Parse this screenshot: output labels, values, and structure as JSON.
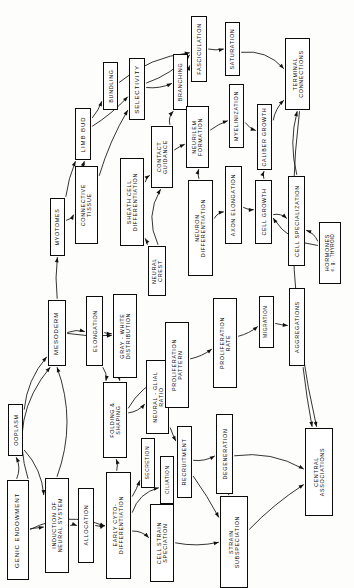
{
  "diagram": {
    "orientation": "sideways-landscape",
    "background_color": "#fdfdfb",
    "line_color": "#111111",
    "box_fill": "#ffffff",
    "box_stroke": "#0b0b0b",
    "nodes": [
      {
        "id": "ooplasm",
        "label": "OOPLASM",
        "x": 8,
        "y": 404,
        "w": 15,
        "h": 52,
        "size": "small"
      },
      {
        "id": "genic_endowment",
        "label": "GENIC ENDOWMENT",
        "x": 7,
        "y": 480,
        "w": 22,
        "h": 100,
        "size": ""
      },
      {
        "id": "induction",
        "label": "INDUCTION OF\nNEURAL SYSTEM",
        "x": 45,
        "y": 478,
        "w": 24,
        "h": 95,
        "size": "small"
      },
      {
        "id": "allocation",
        "label": "ALLOCATION",
        "x": 78,
        "y": 488,
        "w": 16,
        "h": 75,
        "size": "small"
      },
      {
        "id": "early_cyto",
        "label": "EARLY CYTO-\nDIFFERENTIATION",
        "x": 106,
        "y": 472,
        "w": 25,
        "h": 107,
        "size": "small"
      },
      {
        "id": "cell_strain_spec",
        "label": "CELL STRAIN\nSPECIATION",
        "x": 150,
        "y": 504,
        "w": 24,
        "h": 78,
        "size": "small"
      },
      {
        "id": "secretion",
        "label": "SECRETION",
        "x": 141,
        "y": 438,
        "w": 14,
        "h": 50,
        "size": "tiny"
      },
      {
        "id": "ciliation",
        "label": "CILIATION",
        "x": 160,
        "y": 456,
        "w": 14,
        "h": 48,
        "size": "tiny"
      },
      {
        "id": "mesoderm",
        "label": "MESODERM",
        "x": 48,
        "y": 300,
        "w": 18,
        "h": 66,
        "size": ""
      },
      {
        "id": "elongation",
        "label": "ELONGATION",
        "x": 86,
        "y": 296,
        "w": 17,
        "h": 70,
        "size": "small"
      },
      {
        "id": "gray_white",
        "label": "GRAY - WHITE\nDISTRIBUTION",
        "x": 113,
        "y": 294,
        "w": 24,
        "h": 84,
        "size": "small"
      },
      {
        "id": "folding_shaping",
        "label": "FOLDING &\nSHAPING",
        "x": 103,
        "y": 382,
        "w": 24,
        "h": 76,
        "size": "small"
      },
      {
        "id": "neural_glial",
        "label": "NEURAL - GLIAL\nRATIO",
        "x": 146,
        "y": 360,
        "w": 23,
        "h": 74,
        "size": "small"
      },
      {
        "id": "recruitment",
        "label": "RECRUITMENT",
        "x": 177,
        "y": 426,
        "w": 15,
        "h": 72,
        "size": "small"
      },
      {
        "id": "proliferation_pat",
        "label": "PROLIFERATION\nPATTERN",
        "x": 165,
        "y": 322,
        "w": 24,
        "h": 86,
        "size": "small"
      },
      {
        "id": "proliferation_rate",
        "label": "PROLIFERATION\nRATE",
        "x": 213,
        "y": 298,
        "w": 24,
        "h": 90,
        "size": "small"
      },
      {
        "id": "migration",
        "label": "MIGRATION",
        "x": 259,
        "y": 296,
        "w": 15,
        "h": 52,
        "size": "tiny"
      },
      {
        "id": "aggregations",
        "label": "AGGREGATIONS",
        "x": 289,
        "y": 288,
        "w": 16,
        "h": 78,
        "size": "small"
      },
      {
        "id": "degeneration",
        "label": "DEGENERATION",
        "x": 216,
        "y": 414,
        "w": 17,
        "h": 80,
        "size": "small"
      },
      {
        "id": "strain_subspec",
        "label": "STRAIN\nSUBSPECIATION",
        "x": 220,
        "y": 496,
        "w": 28,
        "h": 92,
        "size": "small"
      },
      {
        "id": "central_assoc",
        "label": "CENTRAL\nASSOCIATIONS",
        "x": 305,
        "y": 428,
        "w": 28,
        "h": 88,
        "size": "small"
      },
      {
        "id": "neural_crest",
        "label": "NEURAL\nCREST",
        "x": 148,
        "y": 246,
        "w": 18,
        "h": 50,
        "size": "small"
      },
      {
        "id": "myotomes",
        "label": "MYOTOMES",
        "x": 50,
        "y": 198,
        "w": 15,
        "h": 58,
        "size": "small"
      },
      {
        "id": "connective_tissue",
        "label": "CONNECTIVE\nTISSUE",
        "x": 75,
        "y": 166,
        "w": 23,
        "h": 78,
        "size": "small"
      },
      {
        "id": "limb_bud",
        "label": "LIMB BUD",
        "x": 75,
        "y": 108,
        "w": 16,
        "h": 52,
        "size": ""
      },
      {
        "id": "sheath_cell",
        "label": "SHEATH CELL\nDIFFERENTIATION",
        "x": 120,
        "y": 158,
        "w": 24,
        "h": 88,
        "size": "small"
      },
      {
        "id": "contact_guidance",
        "label": "CONTACT\nGUIDANCE",
        "x": 151,
        "y": 126,
        "w": 22,
        "h": 62,
        "size": "small"
      },
      {
        "id": "bundling",
        "label": "BUNDLING",
        "x": 103,
        "y": 62,
        "w": 15,
        "h": 48,
        "size": "small"
      },
      {
        "id": "selectivity",
        "label": "SELECTIVITY",
        "x": 129,
        "y": 58,
        "w": 16,
        "h": 62,
        "size": ""
      },
      {
        "id": "branching",
        "label": "BRANCHING",
        "x": 173,
        "y": 54,
        "w": 15,
        "h": 56,
        "size": "small"
      },
      {
        "id": "fasciculation",
        "label": "FASCICULATION",
        "x": 191,
        "y": 16,
        "w": 16,
        "h": 66,
        "size": "small"
      },
      {
        "id": "saturation",
        "label": "SATURATION",
        "x": 225,
        "y": 22,
        "w": 15,
        "h": 54,
        "size": "small"
      },
      {
        "id": "neurilem",
        "label": "NEURILEM\nFORMATION",
        "x": 186,
        "y": 106,
        "w": 23,
        "h": 62,
        "size": "small"
      },
      {
        "id": "myelinization",
        "label": "MYELINIZATION",
        "x": 229,
        "y": 84,
        "w": 15,
        "h": 64,
        "size": "small"
      },
      {
        "id": "caliber_growth",
        "label": "CALIBER GROWTH",
        "x": 257,
        "y": 104,
        "w": 15,
        "h": 66,
        "size": "small"
      },
      {
        "id": "terminal_conn",
        "label": "TERMINAL\nCONNECTIONS",
        "x": 285,
        "y": 38,
        "w": 25,
        "h": 72,
        "size": "small"
      },
      {
        "id": "neuron_diff",
        "label": "NEURON\nDIFFERENTIATION",
        "x": 188,
        "y": 180,
        "w": 25,
        "h": 96,
        "size": "small"
      },
      {
        "id": "axon_elongation",
        "label": "AXON ELONGATION",
        "x": 225,
        "y": 166,
        "w": 17,
        "h": 78,
        "size": "small"
      },
      {
        "id": "cell_growth",
        "label": "CELL GROWTH",
        "x": 255,
        "y": 180,
        "w": 17,
        "h": 64,
        "size": "small"
      },
      {
        "id": "cell_specialization",
        "label": "CELL SPECIALIZATION",
        "x": 288,
        "y": 176,
        "w": 17,
        "h": 90,
        "size": "small"
      },
      {
        "id": "hormones",
        "label": "HORMONES",
        "sub": "e. g.  THYROID",
        "x": 319,
        "y": 222,
        "w": 22,
        "h": 62,
        "size": "small"
      }
    ],
    "edges": [
      {
        "from": "genic_endowment",
        "to": "induction"
      },
      {
        "from": "genic_endowment",
        "to": "mesoderm"
      },
      {
        "from": "genic_endowment",
        "to": "early_cyto"
      },
      {
        "from": "genic_endowment",
        "to": "ooplasm"
      },
      {
        "from": "ooplasm",
        "to": "induction"
      },
      {
        "from": "ooplasm",
        "to": "mesoderm"
      },
      {
        "from": "induction",
        "to": "allocation"
      },
      {
        "from": "induction",
        "to": "mesoderm"
      },
      {
        "from": "allocation",
        "to": "early_cyto"
      },
      {
        "from": "early_cyto",
        "to": "secretion"
      },
      {
        "from": "early_cyto",
        "to": "ciliation"
      },
      {
        "from": "early_cyto",
        "to": "cell_strain_spec"
      },
      {
        "from": "early_cyto",
        "to": "folding_shaping"
      },
      {
        "from": "cell_strain_spec",
        "to": "strain_subspec"
      },
      {
        "from": "mesoderm",
        "to": "elongation"
      },
      {
        "from": "mesoderm",
        "to": "myotomes"
      },
      {
        "from": "mesoderm",
        "to": "gray_white"
      },
      {
        "from": "elongation",
        "to": "gray_white"
      },
      {
        "from": "elongation",
        "to": "folding_shaping"
      },
      {
        "from": "gray_white",
        "to": "folding_shaping"
      },
      {
        "from": "folding_shaping",
        "to": "neural_glial"
      },
      {
        "from": "folding_shaping",
        "to": "proliferation_pat"
      },
      {
        "from": "neural_glial",
        "to": "recruitment"
      },
      {
        "from": "neural_glial",
        "to": "proliferation_pat"
      },
      {
        "from": "recruitment",
        "to": "strain_subspec"
      },
      {
        "from": "recruitment",
        "to": "degeneration"
      },
      {
        "from": "proliferation_pat",
        "to": "proliferation_rate"
      },
      {
        "from": "proliferation_rate",
        "to": "migration"
      },
      {
        "from": "migration",
        "to": "aggregations"
      },
      {
        "from": "aggregations",
        "to": "central_assoc"
      },
      {
        "from": "degeneration",
        "to": "central_assoc"
      },
      {
        "from": "strain_subspec",
        "to": "degeneration"
      },
      {
        "from": "strain_subspec",
        "to": "central_assoc"
      },
      {
        "from": "myotomes",
        "to": "connective_tissue"
      },
      {
        "from": "myotomes",
        "to": "limb_bud"
      },
      {
        "from": "connective_tissue",
        "to": "limb_bud"
      },
      {
        "from": "connective_tissue",
        "to": "selectivity"
      },
      {
        "from": "limb_bud",
        "to": "bundling"
      },
      {
        "from": "limb_bud",
        "to": "selectivity"
      },
      {
        "from": "bundling",
        "to": "fasciculation"
      },
      {
        "from": "selectivity",
        "to": "branching"
      },
      {
        "from": "selectivity",
        "to": "fasciculation"
      },
      {
        "from": "branching",
        "to": "fasciculation"
      },
      {
        "from": "fasciculation",
        "to": "saturation"
      },
      {
        "from": "saturation",
        "to": "terminal_conn"
      },
      {
        "from": "neural_crest",
        "to": "sheath_cell"
      },
      {
        "from": "neural_crest",
        "to": "contact_guidance"
      },
      {
        "from": "sheath_cell",
        "to": "contact_guidance"
      },
      {
        "from": "contact_guidance",
        "to": "neurilem"
      },
      {
        "from": "contact_guidance",
        "to": "branching"
      },
      {
        "from": "neurilem",
        "to": "myelinization"
      },
      {
        "from": "myelinization",
        "to": "caliber_growth"
      },
      {
        "from": "caliber_growth",
        "to": "terminal_conn"
      },
      {
        "from": "neuron_diff",
        "to": "axon_elongation"
      },
      {
        "from": "neuron_diff",
        "to": "neurilem"
      },
      {
        "from": "axon_elongation",
        "to": "cell_growth"
      },
      {
        "from": "cell_growth",
        "to": "caliber_growth"
      },
      {
        "from": "cell_growth",
        "to": "cell_specialization"
      },
      {
        "from": "cell_specialization",
        "to": "terminal_conn"
      },
      {
        "from": "hormones",
        "to": "cell_specialization"
      },
      {
        "from": "hormones",
        "to": "cell_growth"
      },
      {
        "from": "terminal_conn",
        "to": "central_assoc"
      }
    ]
  }
}
